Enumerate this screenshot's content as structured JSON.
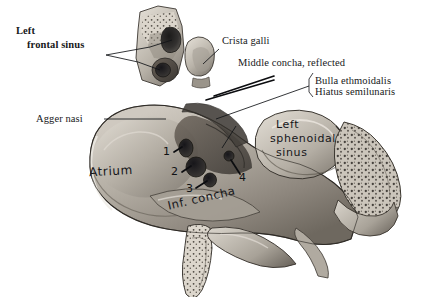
{
  "figure": {
    "kind": "anatomical-illustration",
    "style": "grayscale halftone drawing on white background"
  },
  "printed_labels": [
    {
      "id": "left-frontal-sinus",
      "line1": "Left",
      "line2": "frontal sinus"
    },
    {
      "id": "agger-nasi",
      "text": "Agger nasi"
    },
    {
      "id": "crista-galli",
      "text": "Crista galli"
    },
    {
      "id": "middle-concha-reflected",
      "text": "Middle concha, reflected"
    },
    {
      "id": "bulla-ethmoidalis",
      "text": "Bulla ethmoidalis"
    },
    {
      "id": "hiatus-semilunaris",
      "text": "Hiatus semilunaris"
    }
  ],
  "handwritten_labels": [
    {
      "id": "atrium",
      "text": "Atrium"
    },
    {
      "id": "inf-concha",
      "text": "Inf. concha"
    },
    {
      "id": "left-sphenoidal-sinus",
      "line1": "Left",
      "line2": "sphenoidal",
      "line3": "sinus"
    }
  ],
  "markers": [
    {
      "id": "marker-1",
      "label": "1"
    },
    {
      "id": "marker-2",
      "label": "2"
    },
    {
      "id": "marker-3",
      "label": "3"
    },
    {
      "id": "marker-4",
      "label": "4"
    }
  ],
  "colors": {
    "background": "#ffffff",
    "ink": "#17181a",
    "leader": "#111316",
    "bone_light": "#e8e4dd",
    "bone_mid": "#b9b3a9",
    "bone_shadow": "#6f6a63",
    "cavity_dark": "#2f2d2b"
  }
}
